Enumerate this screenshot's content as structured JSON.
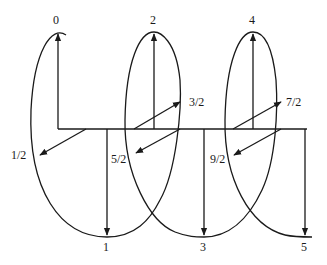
{
  "diagram": {
    "labels": {
      "l0": "0",
      "l1_2": "1/2",
      "l1": "1",
      "l3_2": "3/2",
      "l2": "2",
      "l5_2": "5/2",
      "l3": "3",
      "l7_2": "7/2",
      "l4": "4",
      "l9_2": "9/2",
      "l5": "5"
    },
    "stroke_color": "#1a1a1a",
    "background": "#ffffff"
  }
}
